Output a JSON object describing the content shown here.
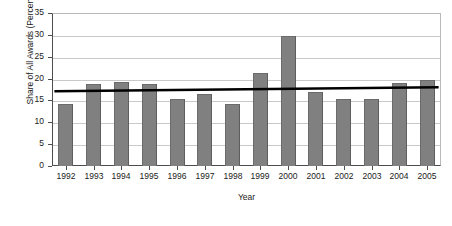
{
  "chart_data": {
    "type": "bar",
    "title": "",
    "xlabel": "Year",
    "ylabel": "Share of All Awards (Percent)",
    "categories": [
      "1992",
      "1993",
      "1994",
      "1995",
      "1996",
      "1997",
      "1998",
      "1999",
      "2000",
      "2001",
      "2002",
      "2003",
      "2004",
      "2005"
    ],
    "values": [
      14.2,
      18.7,
      19.3,
      18.7,
      15.4,
      16.4,
      14.2,
      21.3,
      29.7,
      16.9,
      15.4,
      15.4,
      19.1,
      19.6
    ],
    "ylim": [
      0,
      35
    ],
    "yticks": [
      0,
      5,
      10,
      15,
      20,
      25,
      30,
      35
    ],
    "ytick_labels": [
      "0",
      "5",
      "10",
      "15",
      "20",
      "25",
      "30",
      "35"
    ],
    "grid": true,
    "legend": false,
    "series": [
      {
        "name": "Share of All Awards (Percent)",
        "type": "bar",
        "color": "#808080",
        "values": [
          14.2,
          18.7,
          19.3,
          18.7,
          15.4,
          16.4,
          14.2,
          21.3,
          29.7,
          16.9,
          15.4,
          15.4,
          19.1,
          19.6
        ]
      },
      {
        "name": "Linear trend",
        "type": "line",
        "color": "#000000",
        "endpoints": [
          {
            "x": "1992",
            "y": 17.1
          },
          {
            "x": "2005",
            "y": 18.0
          }
        ]
      }
    ],
    "colors": {
      "bar_fill": "#808080",
      "bar_edge": "#6b6b6b",
      "trend_line": "#000000",
      "gridline": "#c9c9c9",
      "axis": "#4d4d4d",
      "text": "#1a1a1a",
      "background": "#ffffff"
    }
  }
}
